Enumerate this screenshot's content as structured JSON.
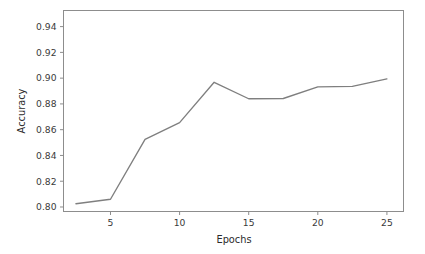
{
  "chart_data": {
    "type": "line",
    "title": "",
    "xlabel": "Epochs",
    "ylabel": "Accuracy",
    "xlim": [
      1.6,
      26.2
    ],
    "ylim": [
      0.7965,
      0.9525
    ],
    "grid": false,
    "legend": null,
    "line_color": "#7f7f7f",
    "x": [
      2.5,
      5,
      7.5,
      10,
      12.5,
      15,
      17.5,
      20,
      22.5,
      25
    ],
    "values": [
      0.8025,
      0.806,
      0.8525,
      0.8655,
      0.8968,
      0.884,
      0.8842,
      0.8932,
      0.8936,
      0.8994
    ],
    "series": [
      {
        "name": "accuracy",
        "values": [
          0.8025,
          0.806,
          0.8525,
          0.8655,
          0.8968,
          0.884,
          0.8842,
          0.8932,
          0.8936,
          0.8994
        ]
      }
    ],
    "xticks": [
      5,
      10,
      15,
      20,
      25
    ],
    "xticklabels": [
      "5",
      "10",
      "15",
      "20",
      "25"
    ],
    "yticks": [
      0.8,
      0.82,
      0.84,
      0.86,
      0.88,
      0.9,
      0.92,
      0.94
    ],
    "yticklabels": [
      "0.80",
      "0.82",
      "0.84",
      "0.86",
      "0.88",
      "0.90",
      "0.92",
      "0.94"
    ]
  },
  "axes": {
    "spine_color": "#8d8d8d",
    "tick_color": "#8d8d8d",
    "text_color": "#3a3a3a"
  }
}
